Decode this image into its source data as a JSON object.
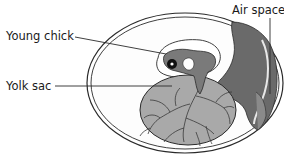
{
  "diagram": {
    "labels": {
      "young_chick": "Young chick",
      "yolk_sac": "Yolk sac",
      "air_space": "Air space"
    },
    "colors": {
      "outline": "#2a2a2a",
      "shell_fill": "#ffffff",
      "membrane_fill": "#f4f4f4",
      "yolk_fill": "#a9a9a9",
      "air_space_fill": "#6a6a6a",
      "embryo_fill": "#7a7a7a",
      "vessels": "#3a3a3a"
    }
  }
}
